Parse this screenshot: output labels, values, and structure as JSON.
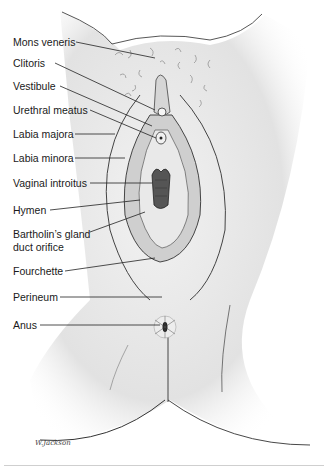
{
  "figure": {
    "type": "anatomical-illustration",
    "signature": "W. Jackson",
    "labels": [
      {
        "id": "mons-veneris",
        "text": "Mons veneris",
        "x": 13,
        "y": 36
      },
      {
        "id": "clitoris",
        "text": "Clitoris",
        "x": 13,
        "y": 57
      },
      {
        "id": "vestibule",
        "text": "Vestibule",
        "x": 13,
        "y": 80
      },
      {
        "id": "urethral-meatus",
        "text": "Urethral meatus",
        "x": 13,
        "y": 104
      },
      {
        "id": "labia-majora",
        "text": "Labia majora",
        "x": 13,
        "y": 128
      },
      {
        "id": "labia-minora",
        "text": "Labia minora",
        "x": 13,
        "y": 152
      },
      {
        "id": "vaginal-introitus",
        "text": "Vaginal introitus",
        "x": 13,
        "y": 177
      },
      {
        "id": "hymen",
        "text": "Hymen",
        "x": 13,
        "y": 204
      },
      {
        "id": "bartholins-line1",
        "text": "Bartholin’s gland",
        "x": 13,
        "y": 228
      },
      {
        "id": "bartholins-line2",
        "text": "duct orifice",
        "x": 13,
        "y": 241
      },
      {
        "id": "fourchette",
        "text": "Fourchette",
        "x": 13,
        "y": 265
      },
      {
        "id": "perineum",
        "text": "Perineum",
        "x": 13,
        "y": 291
      },
      {
        "id": "anus",
        "text": "Anus",
        "x": 13,
        "y": 319
      }
    ]
  }
}
